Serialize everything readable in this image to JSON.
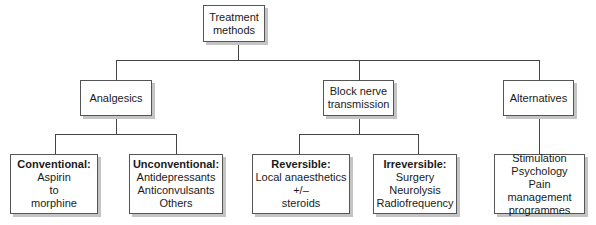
{
  "diagram": {
    "type": "tree",
    "root": {
      "label_lines": [
        "Treatment",
        "methods"
      ]
    },
    "categories": [
      {
        "label_lines": [
          "Analgesics"
        ],
        "children": [
          {
            "title": "Conventional:",
            "lines": [
              "Aspirin",
              "to",
              "morphine"
            ]
          },
          {
            "title": "Unconventional:",
            "lines": [
              "Antidepressants",
              "Anticonvulsants",
              "Others"
            ]
          }
        ]
      },
      {
        "label_lines": [
          "Block nerve",
          "transmission"
        ],
        "children": [
          {
            "title": "Reversible:",
            "lines": [
              "Local anaesthetics",
              "+/–",
              "steroids"
            ]
          },
          {
            "title": "Irreversible:",
            "lines": [
              "Surgery",
              "Neurolysis",
              "Radiofrequency"
            ]
          }
        ]
      },
      {
        "label_lines": [
          "Alternatives"
        ],
        "children": [
          {
            "title": "",
            "lines": [
              "Stimulation",
              "Psychology",
              "Pain management",
              "programmes"
            ]
          }
        ]
      }
    ]
  },
  "colors": {
    "border": "#555555",
    "shadow": "#c4c4c4",
    "line": "#444444",
    "background": "#ffffff"
  }
}
